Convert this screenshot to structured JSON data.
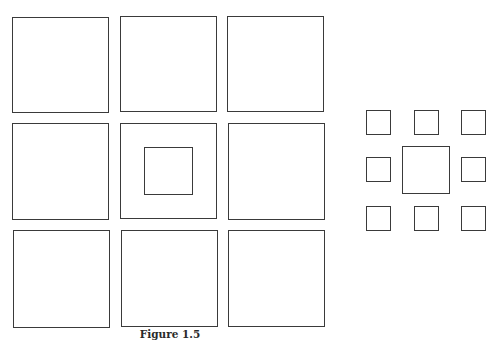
{
  "page": {
    "running_header": "",
    "figure_caption": "Figure 1.5"
  },
  "figure": {
    "left_panel": {
      "description": "3x3 grid of equal large squares; the center square contains a smaller square",
      "rows": 3,
      "cols": 3,
      "center_inner_square": true
    },
    "right_panel": {
      "description": "large central square surrounded by eight smaller squares",
      "center_square": "large",
      "surrounding_squares": 8
    }
  }
}
